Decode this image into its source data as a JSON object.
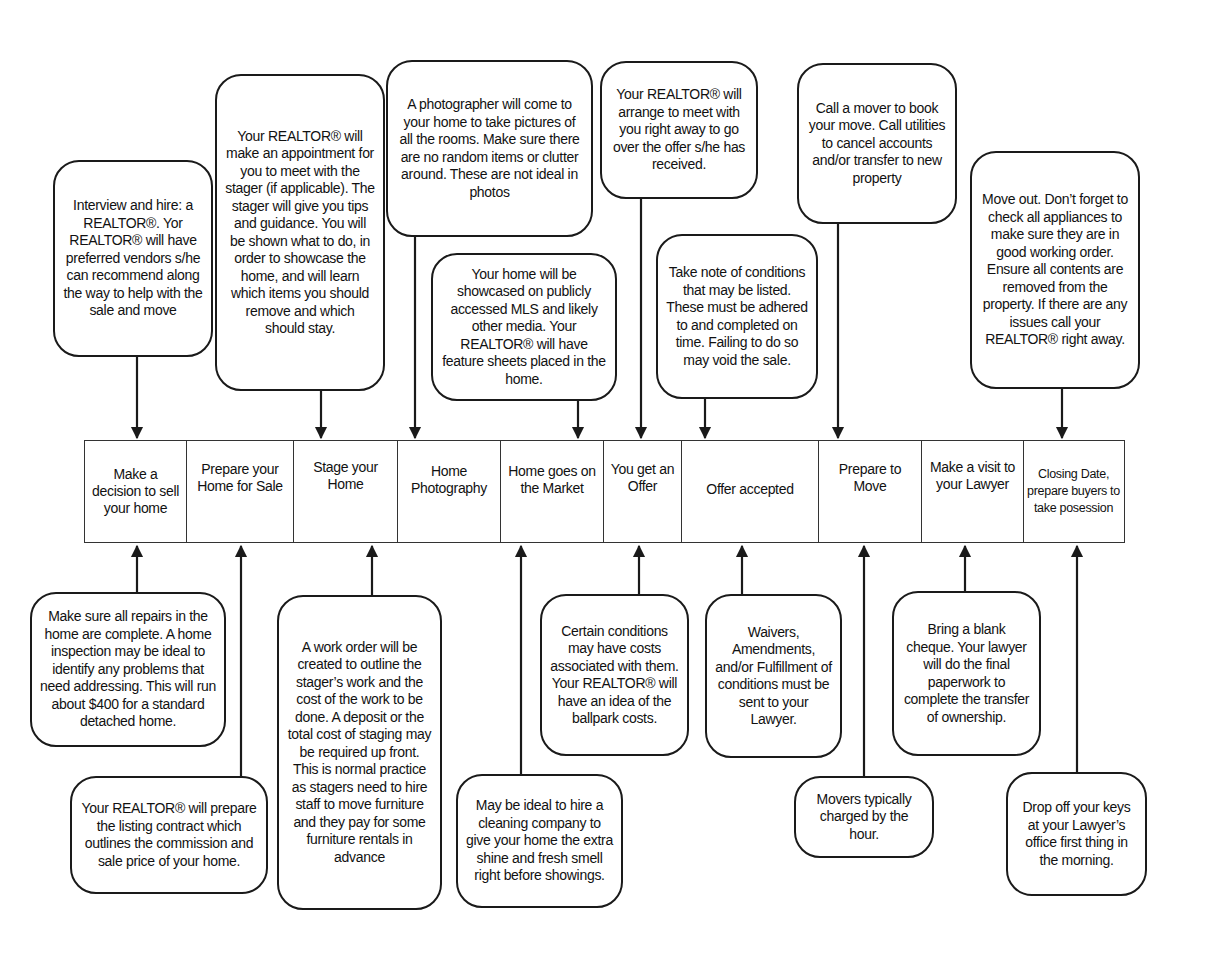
{
  "colors": {
    "stroke": "#1a1a1a",
    "background": "#ffffff",
    "text": "#111111"
  },
  "timeline": {
    "steps": [
      {
        "id": "decide",
        "label": "Make a decision to sell your home"
      },
      {
        "id": "prepare",
        "label": "Prepare your Home for Sale"
      },
      {
        "id": "stage",
        "label": "Stage your Home"
      },
      {
        "id": "photography",
        "label": "Home Photography"
      },
      {
        "id": "market",
        "label": "Home goes on the Market"
      },
      {
        "id": "offer",
        "label": "You get an Offer"
      },
      {
        "id": "accepted",
        "label": "Offer accepted"
      },
      {
        "id": "move",
        "label": "Prepare to Move"
      },
      {
        "id": "lawyer",
        "label": "Make a visit to your Lawyer"
      },
      {
        "id": "closing",
        "label": "Closing Date, prepare buyers to take posession"
      }
    ]
  },
  "top_callouts": [
    {
      "id": "hire-realtor",
      "step": "decide",
      "text": "Interview and hire: a REALTOR®. Yor REALTOR® will have preferred vendors s/he can recommend along the way to help with the sale and move"
    },
    {
      "id": "stager-appointment",
      "step": "stage",
      "text": "Your REALTOR® will make an appointment for you to meet with the stager (if applicable). The stager will give you tips and guidance. You will be shown what to do, in order to showcase the home, and will learn which items you should remove and which should stay."
    },
    {
      "id": "photographer",
      "step": "photography",
      "text": "A photographer will come to your home to take pictures of all the rooms. Make sure there are no random items or clutter around. These are not ideal in photos"
    },
    {
      "id": "mls-showcase",
      "step": "market",
      "text": "Your home will be showcased on publicly accessed MLS and likely other media. Your REALTOR® will have feature sheets placed in the home."
    },
    {
      "id": "review-offer",
      "step": "offer",
      "text": "Your REALTOR® will arrange to meet with you right away to go over the offer s/he has received."
    },
    {
      "id": "conditions-note",
      "step": "accepted",
      "text": "Take note of conditions that may be listed. These must be adhered to and completed on time. Failing to do so may void the sale."
    },
    {
      "id": "book-mover",
      "step": "move",
      "text": "Call a mover to book your move. Call utilities to cancel accounts and/or transfer to new property"
    },
    {
      "id": "move-out",
      "step": "closing",
      "text": "Move out. Don’t forget to check all appliances to make sure they are in good working order. Ensure all contents are removed from the property. If there are any issues call your REALTOR® right away."
    }
  ],
  "bottom_callouts": [
    {
      "id": "repairs",
      "step": "decide",
      "text": "Make sure all repairs in the home are complete. A home inspection may be ideal to identify any problems that need addressing. This will run about $400 for a standard detached home."
    },
    {
      "id": "listing-contract",
      "step": "prepare",
      "text": "Your REALTOR® will prepare the listing contract which outlines the commission and sale price of your home."
    },
    {
      "id": "work-order",
      "step": "stage",
      "text": "A work order will be created to outline the stager’s work and the cost of the work to be done. A deposit or the total cost of staging may be required up front. This is normal practice as stagers need to hire staff to move furniture and they pay for some furniture rentals in advance"
    },
    {
      "id": "cleaning",
      "step": "market",
      "text": "May be ideal to hire a cleaning company to give your home the extra shine and fresh smell right before showings."
    },
    {
      "id": "condition-costs",
      "step": "offer",
      "text": "Certain conditions may have costs associated with them. Your REALTOR® will have an idea of the ballpark costs."
    },
    {
      "id": "waivers",
      "step": "accepted",
      "text": "Waivers, Amendments, and/or Fulfillment of conditions must be sent to your Lawyer."
    },
    {
      "id": "movers-hourly",
      "step": "move",
      "text": "Movers typically charged by the hour."
    },
    {
      "id": "blank-cheque",
      "step": "lawyer",
      "text": "Bring a blank cheque. Your lawyer will do the final paperwork to complete the transfer of ownership."
    },
    {
      "id": "drop-keys",
      "step": "closing",
      "text": "Drop off your keys at your Lawyer’s office first thing in the morning."
    }
  ]
}
